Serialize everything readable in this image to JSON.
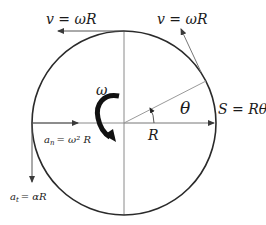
{
  "diagram": {
    "colors": {
      "circle": "#2a2a2a",
      "axis": "#8a8a8a",
      "arrow": "#3a3a3a",
      "rotation_arrow": "#111111",
      "text": "#1a1a1a"
    },
    "circle": {
      "cx": 124,
      "cy": 123,
      "r": 92
    },
    "labels": {
      "velocity_top": "v = ωR",
      "velocity_tangent": "v = ωR",
      "angular_velocity": "ω",
      "arc_length": "S = Rθ",
      "angle": "θ",
      "radius": "R",
      "centripetal_accel_symbol": "a",
      "centripetal_accel_sub": "n",
      "centripetal_accel_rhs": "= ω² R",
      "tangential_accel_symbol": "a",
      "tangential_accel_sub": "t",
      "tangential_accel_rhs": "= αR"
    },
    "vectors": [
      {
        "name": "velocity-top",
        "from": [
          124,
          31
        ],
        "to": [
          58,
          31
        ]
      },
      {
        "name": "velocity-tangent",
        "from": [
          201,
          72
        ],
        "to": [
          181,
          29
        ]
      },
      {
        "name": "radius",
        "from": [
          124,
          123
        ],
        "to": [
          214,
          123
        ]
      },
      {
        "name": "centripetal-accel",
        "from": [
          32,
          123
        ],
        "to": [
          78,
          123
        ]
      },
      {
        "name": "tangential-accel",
        "from": [
          32,
          123
        ],
        "to": [
          32,
          182
        ]
      }
    ]
  }
}
